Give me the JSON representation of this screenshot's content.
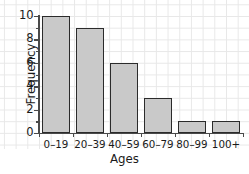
{
  "chart_data": {
    "type": "bar",
    "title": "",
    "xlabel": "Ages",
    "ylabel": "Frequency",
    "categories": [
      "0–19",
      "20–39",
      "40–59",
      "60–79",
      "80–99",
      "100+"
    ],
    "values": [
      10,
      9,
      6,
      3,
      1,
      1
    ],
    "ylim": [
      0,
      10
    ],
    "ytick_labels": [
      "0",
      "2",
      "4",
      "6",
      "8",
      "10"
    ],
    "ytick_values": [
      0,
      2,
      4,
      6,
      8,
      10
    ],
    "yminor_values": [
      1,
      3,
      5,
      7,
      9
    ],
    "grid": true,
    "legend": null,
    "colors": {
      "bar_fill": "#c9c9c9",
      "bar_edge": "#2b2b2b",
      "axis": "#4a4a4a",
      "grid": "#e8e8e8",
      "text": "#1a1a1a",
      "background": "#ffffff"
    }
  }
}
